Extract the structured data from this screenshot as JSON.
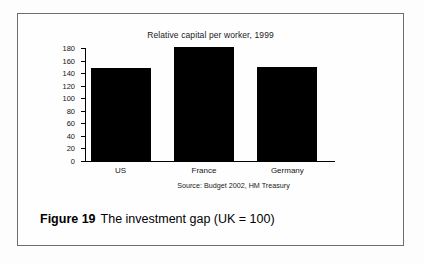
{
  "figure": {
    "caption_number": "Figure 19",
    "caption_text": "The investment gap (UK = 100)"
  },
  "chart_data": {
    "type": "bar",
    "title": "Relative capital per worker, 1999",
    "xlabel": "",
    "ylabel": "",
    "categories": [
      "US",
      "France",
      "Germany"
    ],
    "values": [
      148,
      181,
      150
    ],
    "ylim": [
      0,
      180
    ],
    "yticks": [
      0,
      20,
      40,
      60,
      80,
      100,
      120,
      140,
      160,
      180
    ],
    "ytick_labels": [
      "0",
      "20",
      "40",
      "60",
      "80",
      "100",
      "120",
      "140",
      "160",
      "180"
    ],
    "grid": false,
    "legend": false,
    "bar_color": "#000000",
    "source": "Source: Budget 2002, HM Treasury"
  }
}
